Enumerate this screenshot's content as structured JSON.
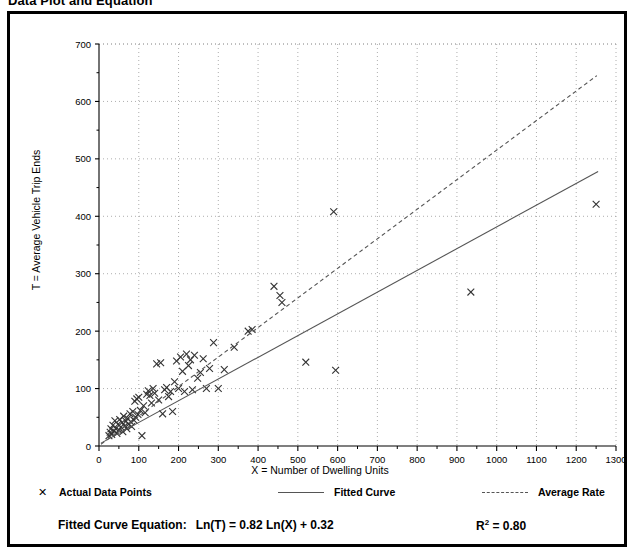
{
  "page": {
    "title": "Data Plot and Equation"
  },
  "legend": {
    "items": [
      {
        "label": "Actual Data Points",
        "style": "marker",
        "glyph": "✕"
      },
      {
        "label": "Fitted Curve",
        "style": "solid"
      },
      {
        "label": "Average Rate",
        "style": "dashed"
      }
    ]
  },
  "footer": {
    "equation_label": "Fitted Curve Equation:",
    "equation": "Ln(T) = 0.82 Ln(X) + 0.32",
    "r_squared_symbol": "R",
    "r_squared_exponent": "2",
    "r_squared_value": "= 0.80"
  },
  "colors": {
    "frame": "#000000",
    "grid": "#999999",
    "axis": "#000000",
    "marker": "#333333",
    "fitted_curve": "#555555",
    "average_rate": "#555555",
    "background": "#ffffff"
  },
  "chart_data": {
    "type": "scatter",
    "title": "Data Plot and Equation",
    "xlabel": "X = Number of Dwelling Units",
    "ylabel": "T = Average Vehicle Trip Ends",
    "xlim": [
      0,
      1300
    ],
    "ylim": [
      0,
      700
    ],
    "xticks": [
      0,
      100,
      200,
      300,
      400,
      500,
      600,
      700,
      800,
      900,
      1000,
      1100,
      1200,
      1300
    ],
    "yticks": [
      0,
      100,
      200,
      300,
      400,
      500,
      600,
      700
    ],
    "x_minor_tick_step": 50,
    "grid": true,
    "grid_style": "dotted",
    "legend_position": "below-plot",
    "series": [
      {
        "name": "Actual Data Points",
        "type": "scatter",
        "marker": "x",
        "points": [
          [
            25,
            18
          ],
          [
            28,
            24
          ],
          [
            30,
            30
          ],
          [
            32,
            20
          ],
          [
            35,
            36
          ],
          [
            38,
            26
          ],
          [
            40,
            44
          ],
          [
            42,
            30
          ],
          [
            45,
            22
          ],
          [
            48,
            38
          ],
          [
            50,
            28
          ],
          [
            52,
            46
          ],
          [
            55,
            33
          ],
          [
            58,
            41
          ],
          [
            60,
            25
          ],
          [
            62,
            52
          ],
          [
            65,
            35
          ],
          [
            68,
            43
          ],
          [
            70,
            30
          ],
          [
            72,
            48
          ],
          [
            75,
            38
          ],
          [
            78,
            56
          ],
          [
            80,
            42
          ],
          [
            82,
            34
          ],
          [
            85,
            60
          ],
          [
            88,
            45
          ],
          [
            90,
            78
          ],
          [
            92,
            50
          ],
          [
            95,
            82
          ],
          [
            98,
            55
          ],
          [
            100,
            85
          ],
          [
            104,
            62
          ],
          [
            108,
            18
          ],
          [
            112,
            70
          ],
          [
            116,
            58
          ],
          [
            120,
            90
          ],
          [
            124,
            96
          ],
          [
            128,
            88
          ],
          [
            132,
            75
          ],
          [
            136,
            100
          ],
          [
            140,
            92
          ],
          [
            145,
            143
          ],
          [
            150,
            80
          ],
          [
            155,
            145
          ],
          [
            160,
            56
          ],
          [
            165,
            98
          ],
          [
            170,
            102
          ],
          [
            175,
            86
          ],
          [
            180,
            95
          ],
          [
            185,
            60
          ],
          [
            190,
            112
          ],
          [
            195,
            148
          ],
          [
            200,
            100
          ],
          [
            205,
            155
          ],
          [
            210,
            130
          ],
          [
            215,
            95
          ],
          [
            220,
            160
          ],
          [
            225,
            140
          ],
          [
            230,
            150
          ],
          [
            235,
            98
          ],
          [
            240,
            158
          ],
          [
            248,
            118
          ],
          [
            255,
            128
          ],
          [
            262,
            152
          ],
          [
            270,
            100
          ],
          [
            278,
            135
          ],
          [
            288,
            180
          ],
          [
            300,
            100
          ],
          [
            315,
            133
          ],
          [
            340,
            172
          ],
          [
            375,
            200
          ],
          [
            385,
            203
          ],
          [
            440,
            278
          ],
          [
            455,
            262
          ],
          [
            460,
            250
          ],
          [
            520,
            146
          ],
          [
            590,
            408
          ],
          [
            595,
            132
          ],
          [
            935,
            268
          ],
          [
            1250,
            421
          ]
        ]
      },
      {
        "name": "Fitted Curve",
        "type": "line",
        "style": "solid",
        "equation": "Ln(T) = 0.82 Ln(X) + 0.32",
        "r_squared": 0.8,
        "endpoints": [
          [
            5,
            5
          ],
          [
            1255,
            478
          ]
        ]
      },
      {
        "name": "Average Rate",
        "type": "line",
        "style": "dashed",
        "endpoints": [
          [
            5,
            3
          ],
          [
            1252,
            645
          ]
        ]
      }
    ]
  }
}
